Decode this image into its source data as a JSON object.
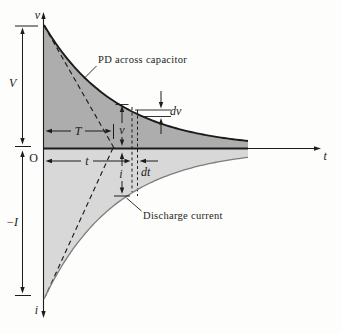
{
  "figure": {
    "title_hidden": "",
    "colors": {
      "background": "#fdfdfb",
      "upper_fill": "#adadad",
      "lower_fill": "#d8d8d8",
      "v_curve_stroke": "#1a1a1a",
      "i_curve_stroke": "#7d7d7d",
      "ink": "#1c1c1c"
    },
    "axis_labels": {
      "y_top": "v",
      "y_bottom": "i",
      "x_right": "t",
      "origin": "O"
    },
    "measurements": {
      "initial_pd": "V",
      "initial_current": "−I",
      "time_constant": "T",
      "time": "t",
      "pd_at_t": "v",
      "current_at_t": "i",
      "pd_increment": "dv",
      "time_increment": "dt"
    },
    "annotations": {
      "upper_curve": "PD across capacitor",
      "lower_curve": "Discharge current"
    },
    "curves": {
      "upper": {
        "label": "PD across capacitor",
        "shape": "exponential decay",
        "starts_at": "V",
        "tends_to": "0"
      },
      "lower": {
        "label": "Discharge current",
        "shape": "exponential decay",
        "starts_at": "−I",
        "tends_to": "0"
      }
    }
  }
}
